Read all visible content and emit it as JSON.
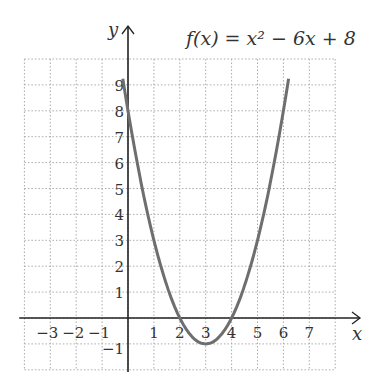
{
  "title": "f(x) = x² − 6x + 8",
  "chart_data": {
    "type": "line",
    "xlabel": "x",
    "ylabel": "y",
    "xlim": [
      -4,
      8
    ],
    "ylim": [
      -2,
      10
    ],
    "grid": true,
    "x_ticks": [
      -3,
      -2,
      -1,
      1,
      2,
      3,
      4,
      5,
      6,
      7
    ],
    "y_ticks": [
      -1,
      1,
      2,
      3,
      4,
      5,
      6,
      7,
      8,
      9
    ],
    "series": [
      {
        "name": "f(x) = x^2 - 6x + 8",
        "x": [
          -0.2,
          0,
          1,
          2,
          3,
          4,
          5,
          6,
          6.2
        ],
        "y": [
          9.24,
          8,
          3,
          0,
          -1,
          0,
          3,
          8,
          9.24
        ]
      }
    ]
  },
  "labels": {
    "x_axis": "x",
    "y_axis": "y"
  }
}
